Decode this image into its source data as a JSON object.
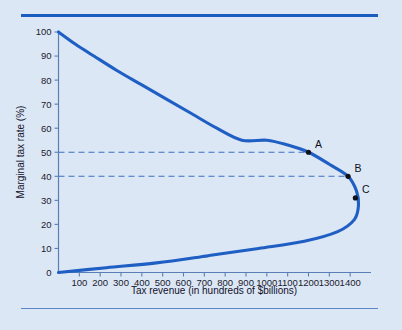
{
  "figure": {
    "background_color": "#dce7f5",
    "curve_color": "#1f5fc4",
    "axis_color": "#5a7fb5",
    "dash_color": "#3b6fc0",
    "point_color": "#101018",
    "rule_top_color": "#1b5cbf",
    "rule_bottom_color": "#5b86c8"
  },
  "chart_data": {
    "type": "line",
    "title": "",
    "subtitle": "",
    "xlabel": "Tax revenue (in hundreds of $billions)",
    "ylabel": "Marginal tax rate (%)",
    "xlim": [
      0,
      1500
    ],
    "ylim": [
      0,
      100
    ],
    "grid": false,
    "legend_position": "none",
    "x_ticks": [
      100,
      200,
      300,
      400,
      500,
      600,
      700,
      800,
      900,
      1000,
      1100,
      1200,
      1300,
      1400
    ],
    "x_tick_labels": [
      "100",
      "200",
      "300",
      "400",
      "500",
      "600",
      "700",
      "800",
      "900",
      "1000",
      "1100",
      "1200",
      "1300",
      "1400"
    ],
    "y_ticks": [
      0,
      10,
      20,
      30,
      40,
      50,
      60,
      70,
      80,
      90,
      100
    ],
    "y_tick_labels": [
      "0",
      "10",
      "20",
      "30",
      "40",
      "50",
      "60",
      "70",
      "80",
      "90",
      "100"
    ],
    "series": [
      {
        "name": "Laffer curve",
        "color": "#1f5fc4",
        "note": "backward-bending Laffer curve: revenue as function of marginal tax rate",
        "points": [
          {
            "x": 0,
            "y": 100
          },
          {
            "x": 80,
            "y": 95
          },
          {
            "x": 170,
            "y": 90
          },
          {
            "x": 280,
            "y": 84
          },
          {
            "x": 400,
            "y": 78
          },
          {
            "x": 520,
            "y": 72
          },
          {
            "x": 640,
            "y": 66
          },
          {
            "x": 760,
            "y": 60
          },
          {
            "x": 880,
            "y": 55
          },
          {
            "x": 1000,
            "y": 55
          },
          {
            "x": 1100,
            "y": 53
          },
          {
            "x": 1200,
            "y": 50
          },
          {
            "x": 1300,
            "y": 45
          },
          {
            "x": 1390,
            "y": 40
          },
          {
            "x": 1430,
            "y": 34
          },
          {
            "x": 1440,
            "y": 28
          },
          {
            "x": 1420,
            "y": 22
          },
          {
            "x": 1340,
            "y": 17
          },
          {
            "x": 1180,
            "y": 13
          },
          {
            "x": 960,
            "y": 10
          },
          {
            "x": 720,
            "y": 7
          },
          {
            "x": 470,
            "y": 4
          },
          {
            "x": 230,
            "y": 2
          },
          {
            "x": 0,
            "y": 0
          }
        ]
      }
    ],
    "annotations": [
      {
        "label": "A",
        "x": 1200,
        "y": 50,
        "marker": true
      },
      {
        "label": "B",
        "x": 1390,
        "y": 40,
        "marker": true
      },
      {
        "label": "C",
        "x": 1425,
        "y": 31,
        "marker": true
      }
    ],
    "reference_lines": [
      {
        "axis": "y",
        "value": 50,
        "style": "dashed",
        "from_x": 0,
        "to_x": 1200
      },
      {
        "axis": "y",
        "value": 40,
        "style": "dashed",
        "from_x": 0,
        "to_x": 1390
      }
    ]
  }
}
